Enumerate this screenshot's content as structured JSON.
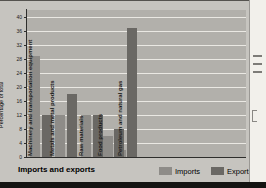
{
  "page": {
    "title": "Imports and exports"
  },
  "colors": {
    "page_bg": "#c6c4bf",
    "plot_bg": "#b2b0ab",
    "gridline": "#eae8e3",
    "imports_bar": "#8e8c88",
    "exports_bar": "#6a6864",
    "axis": "#2e2e2c",
    "text": "#1c1c1a"
  },
  "legend": {
    "items": [
      {
        "label": "Imports",
        "color": "#8e8c88"
      },
      {
        "label": "Exports",
        "color": "#6a6864"
      }
    ]
  },
  "chart_data": {
    "type": "bar",
    "title": "Imports and exports",
    "ylabel": "Percentage of total",
    "xlabel": "",
    "ylim": [
      0,
      40
    ],
    "yticks": [
      0,
      4,
      8,
      12,
      16,
      20,
      24,
      28,
      32,
      36,
      40
    ],
    "grid": true,
    "legend_position": "bottom-right",
    "categories": [
      "Machinery and transportation equipment",
      "Metals and metal products",
      "Raw materials",
      "Food products",
      "Petroleum and natural gas"
    ],
    "series": [
      {
        "name": "Imports",
        "values": [
          29,
          12,
          12,
          6,
          2
        ]
      },
      {
        "name": "Exports",
        "values": [
          12,
          18,
          12,
          8,
          37
        ]
      }
    ]
  }
}
